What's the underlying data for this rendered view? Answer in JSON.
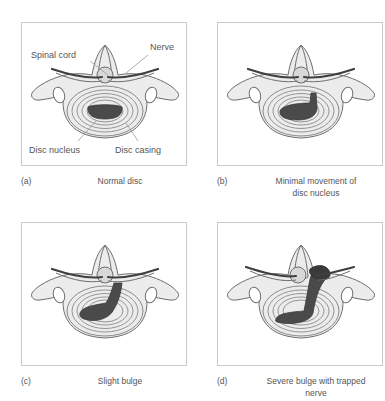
{
  "figure": {
    "colors": {
      "panel_border": "#c9c9c9",
      "bone_fill": "#ececec",
      "bone_outline": "#6e6e6e",
      "disc_ring": "#8a8a8a",
      "nucleus_fill": "#4a4a4a",
      "nerve_stroke": "#3f3f3f",
      "cord_fill": "#d8d8d8",
      "label_text": "#555555"
    }
  },
  "panels": [
    {
      "tag": "(a)",
      "caption": "Normal disc",
      "labels": {
        "spinal_cord": "Spinal cord",
        "nerve": "Nerve",
        "disc_nucleus": "Disc nucleus",
        "disc_casing": "Disc casing"
      }
    },
    {
      "tag": "(b)",
      "caption": "Minimal movement of\ndisc nucleus"
    },
    {
      "tag": "(c)",
      "caption": "Slight bulge"
    },
    {
      "tag": "(d)",
      "caption": "Severe bulge with trapped\nnerve"
    }
  ]
}
